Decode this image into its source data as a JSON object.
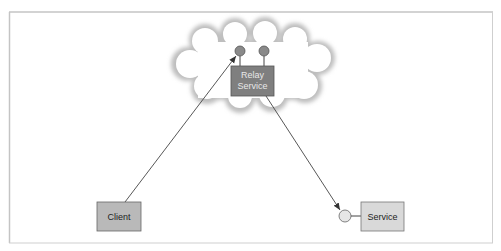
{
  "diagram": {
    "nodes": {
      "relay": {
        "line1": "Relay",
        "line2": "Service"
      },
      "client": {
        "label": "Client"
      },
      "service": {
        "label": "Service"
      }
    },
    "edges": [
      {
        "from": "client",
        "to": "relay-endpoint-1",
        "arrow": true
      },
      {
        "from": "relay",
        "to": "service-endpoint",
        "arrow": true
      }
    ],
    "colors": {
      "frame": "#bdbdbd",
      "relay_box": "#7f7f7f",
      "relay_endpoint": "#8a8a8a",
      "client_box": "#b9b9b9",
      "service_box": "#d9d9d9",
      "service_endpoint": "#e6e6e6",
      "line": "#444444"
    }
  }
}
